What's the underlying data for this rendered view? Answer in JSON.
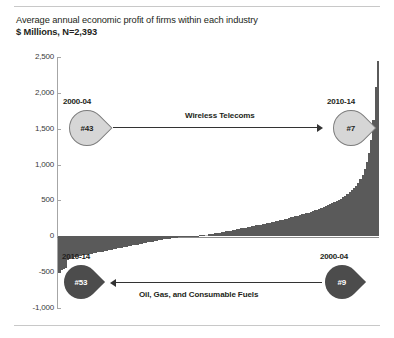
{
  "title": {
    "line1": "Average annual economic profit of firms within each industry",
    "line2": "$ Millions, N=2,393"
  },
  "chart_data": {
    "type": "bar",
    "title": "Average annual economic profit of firms within each industry",
    "subtitle": "$ Millions, N=2,393",
    "xlabel": "",
    "ylabel": "$ Millions",
    "ylim": [
      -1000,
      2500
    ],
    "yticks": [
      -1000,
      -500,
      0,
      500,
      1000,
      1500,
      2000,
      2500
    ],
    "ytick_labels": [
      "-1,000",
      "-500",
      "0",
      "500",
      "1,000",
      "1,500",
      "2,000",
      "2,500"
    ],
    "grid": false,
    "legend": null,
    "sample_size": 2393,
    "series_name": "Economic profit by industry (sorted ascending)",
    "bar_color": "#5a5a5a",
    "highlight_color": "#c9c9c9",
    "highlight_index": 68,
    "values": [
      -505,
      -470,
      -455,
      -445,
      -330,
      -315,
      -300,
      -292,
      -285,
      -278,
      -272,
      -266,
      -260,
      -254,
      -248,
      -242,
      -236,
      -230,
      -224,
      -218,
      -212,
      -206,
      -200,
      -194,
      -188,
      -182,
      -176,
      -170,
      -164,
      -158,
      -152,
      -146,
      -140,
      -134,
      -128,
      -122,
      -116,
      -110,
      -104,
      -98,
      -92,
      -86,
      -80,
      -74,
      -68,
      -62,
      -56,
      -50,
      -44,
      -40,
      -36,
      -32,
      -28,
      -24,
      -20,
      -16,
      -13,
      -10,
      -7,
      -4,
      -2,
      0,
      2,
      5,
      8,
      12,
      16,
      20,
      24,
      28,
      33,
      38,
      43,
      48,
      53,
      58,
      63,
      68,
      74,
      80,
      86,
      92,
      98,
      104,
      110,
      116,
      122,
      128,
      134,
      140,
      146,
      152,
      158,
      164,
      170,
      176,
      183,
      190,
      197,
      204,
      211,
      218,
      225,
      232,
      240,
      248,
      256,
      264,
      272,
      280,
      288,
      296,
      305,
      314,
      323,
      332,
      342,
      352,
      362,
      372,
      383,
      394,
      406,
      418,
      431,
      444,
      458,
      473,
      489,
      506,
      524,
      543,
      564,
      587,
      612,
      640,
      672,
      708,
      750,
      800,
      860,
      935,
      1030,
      1160,
      1340,
      1620,
      2080,
      2450
    ]
  },
  "callouts": [
    {
      "name": "wireless-telecoms",
      "label": "Wireless Telecoms",
      "left": {
        "period": "2000-04",
        "rank": "#43",
        "style": "light"
      },
      "right": {
        "period": "2010-14",
        "rank": "#7",
        "style": "light"
      },
      "arrow_direction": "right"
    },
    {
      "name": "oil-gas-consumable-fuels",
      "label": "Oil, Gas, and Consumable Fuels",
      "left": {
        "period": "2010-14",
        "rank": "#53",
        "style": "dark"
      },
      "right": {
        "period": "2000-04",
        "rank": "#9",
        "style": "dark"
      },
      "arrow_direction": "left"
    }
  ]
}
